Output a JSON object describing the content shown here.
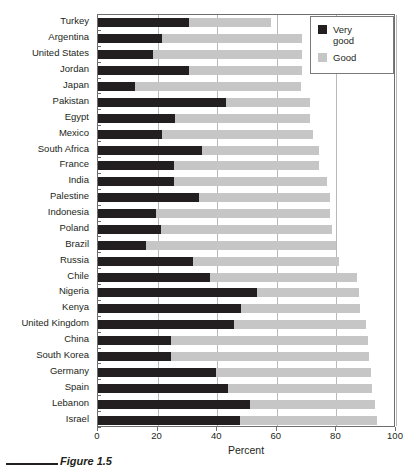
{
  "figure": {
    "caption": "Figure 1.5"
  },
  "chart_data": {
    "type": "bar",
    "orientation": "horizontal",
    "stacked": true,
    "title": "",
    "xlabel": "Percent",
    "ylabel": "",
    "xlim": [
      0,
      100
    ],
    "xticks": [
      0,
      20,
      40,
      60,
      80,
      100
    ],
    "xtick_labels": [
      "0",
      "20",
      "40",
      "60",
      "80",
      "100"
    ],
    "grid": "vertical",
    "legend_position": "top-right",
    "categories": [
      "Turkey",
      "Argentina",
      "United States",
      "Jordan",
      "Japan",
      "Pakistan",
      "Egypt",
      "Mexico",
      "South Africa",
      "France",
      "India",
      "Palestine",
      "Indonesia",
      "Poland",
      "Brazil",
      "Russia",
      "Chile",
      "Nigeria",
      "Kenya",
      "United Kingdom",
      "China",
      "South Korea",
      "Germany",
      "Spain",
      "Lebanon",
      "Israel"
    ],
    "series": [
      {
        "name": "Very good",
        "color": "#231f20",
        "values": [
          30.5,
          21.5,
          18.5,
          30.5,
          12.5,
          43,
          26,
          21.5,
          35,
          25.5,
          25.5,
          34,
          19.5,
          21,
          16,
          32,
          37.5,
          53.5,
          48,
          45.5,
          24.5,
          24.5,
          39.5,
          43.5,
          51,
          47.5
        ]
      },
      {
        "name": "Good",
        "color": "#c6c6c6",
        "values": [
          27.5,
          47,
          50,
          38,
          55.5,
          28,
          45,
          50.5,
          39,
          48.5,
          51.5,
          44,
          58.5,
          57.5,
          64,
          49,
          49.5,
          34,
          40,
          44.5,
          66,
          66.5,
          52,
          48.5,
          42,
          46
        ]
      }
    ],
    "totals": [
      58,
      68.5,
      68.5,
      68.5,
      68,
      71,
      71,
      72,
      74,
      74,
      77,
      78,
      78,
      78.5,
      80,
      81,
      87,
      87.5,
      88,
      90,
      90.5,
      91,
      91.5,
      92,
      93,
      93.5
    ],
    "legend_entries": [
      {
        "label": "Very\ngood",
        "color": "#231f20"
      },
      {
        "label": "Good",
        "color": "#c6c6c6"
      }
    ]
  }
}
